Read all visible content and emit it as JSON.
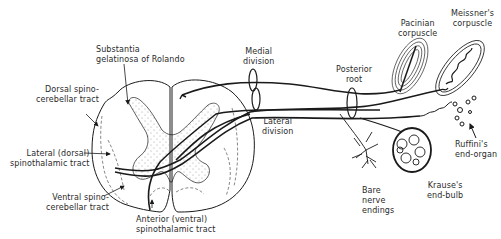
{
  "figure": {
    "type": "anatomical line drawing",
    "colors": {
      "ink": "#1a1a1a",
      "label_text": "#2a2a2a",
      "stipple": "#8a8a8a",
      "background": "#ffffff"
    }
  },
  "labels": {
    "substantia": {
      "line1": "Substantia",
      "line2": "gelatinosa of Rolando"
    },
    "dorsal_spino": {
      "line1": "Dorsal spino-",
      "line2": "cerebellar tract"
    },
    "lateral_spinothalamic": {
      "line1": "Lateral (dorsal)",
      "line2": "spinothalamic tract"
    },
    "ventral_spino": {
      "line1": "Ventral spino-",
      "line2": "cerebellar tract"
    },
    "anterior_spinothalamic": {
      "line1": "Anterior (ventral)",
      "line2": "spinothalamic tract"
    },
    "medial_division": {
      "line1": "Medial",
      "line2": "division"
    },
    "lateral_division": {
      "line1": "Lateral",
      "line2": "division"
    },
    "posterior_root": {
      "line1": "Posterior",
      "line2": "root"
    },
    "pacinian": {
      "line1": "Pacinian",
      "line2": "corpuscle"
    },
    "meissner": {
      "line1": "Meissner's",
      "line2": "corpuscle"
    },
    "ruffini": {
      "line1": "Ruffini's",
      "line2": "end-organ"
    },
    "krause": {
      "line1": "Krause's",
      "line2": "end-bulb"
    },
    "bare_nerve": {
      "line1": "Bare",
      "line2": "nerve",
      "line3": "endings"
    }
  }
}
